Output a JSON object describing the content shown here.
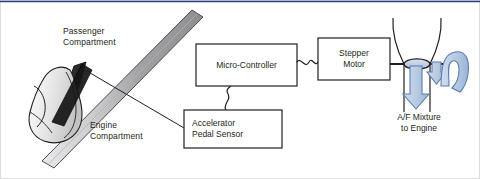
{
  "figure": {
    "type": "schematic-diagram",
    "width": 480,
    "height": 179,
    "background": "#ffffff",
    "top_rule_color": "#2c3f8c",
    "border_color": "#d9d9d9"
  },
  "regions": {
    "passenger": {
      "label": "Passenger\nCompartment",
      "x": 63,
      "y": 26
    },
    "engine": {
      "label": "Engine\nCompartment",
      "x": 90,
      "y": 120
    }
  },
  "boxes": [
    {
      "id": "micro-controller",
      "label": "Micro-Controller",
      "x": 196,
      "y": 44,
      "w": 101,
      "h": 42,
      "stroke": "#231f20",
      "fill": "#ffffff"
    },
    {
      "id": "stepper-motor",
      "label": "Stepper\nMotor",
      "x": 318,
      "y": 38,
      "w": 72,
      "h": 42,
      "stroke": "#231f20",
      "fill": "#ffffff"
    },
    {
      "id": "accelerator-pedal-sensor",
      "label": "Accelerator\nPedal Sensor",
      "x": 184,
      "y": 110,
      "w": 98,
      "h": 38,
      "stroke": "#231f20",
      "fill": "#ffffff"
    }
  ],
  "throttle": {
    "label": "A/F Mixture\nto Engine",
    "label_x": 390,
    "label_y": 114,
    "valve_fill": "#c6d3e6",
    "valve_stroke": "#231f20",
    "arrow_fill": "#b9cce3",
    "arrow_stroke": "#5b7db1"
  },
  "firewall": {
    "name": "firewall-bulkhead",
    "fill_light": "#e4e4e6",
    "fill_mid": "#a7a7aa",
    "fill_dark": "#87878b",
    "stroke": "#4d4d4f"
  },
  "pedal": {
    "name": "foot-on-accelerator-pedal",
    "shoe_stroke": "#231f20",
    "shoe_fill_light": "#f2f2f2",
    "shoe_fill_dark": "#1a1a1a",
    "pedal_fill": "#2b2b2b"
  },
  "connections": [
    {
      "from": "accelerator-pedal",
      "to": "accelerator-pedal-sensor",
      "style": "solid-line"
    },
    {
      "from": "accelerator-pedal-sensor",
      "to": "micro-controller",
      "style": "wavy-wire"
    },
    {
      "from": "micro-controller",
      "to": "stepper-motor",
      "style": "wavy-wire"
    },
    {
      "from": "stepper-motor",
      "to": "throttle-valve-shaft",
      "style": "solid-shaft"
    }
  ],
  "colors": {
    "ink": "#231f20",
    "blue_accent": "#5b7db1",
    "blue_fill": "#b9cce3",
    "rule": "#2c3f8c"
  }
}
